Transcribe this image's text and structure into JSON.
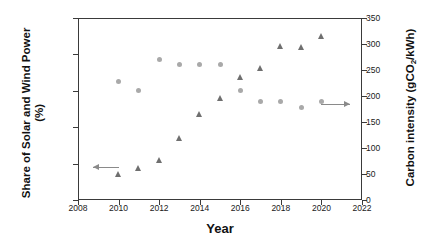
{
  "chart_data": {
    "type": "scatter",
    "title": "",
    "xlabel": "Year",
    "ylabel": "Share of Solar and Wind Power (%)",
    "ylabel_line1": "Share of Solar and Wind Power",
    "ylabel_line2": "(%)",
    "y2label": "Carbon intensity (gCO2/kWh)",
    "y2label_pre": "Carbon intensity (gCO",
    "y2label_sub": "2",
    "y2label_post": "/kWh)",
    "xlim": [
      2008,
      2022
    ],
    "ylim": [
      0,
      25
    ],
    "y2lim": [
      0,
      350
    ],
    "xticks": [
      2008,
      2010,
      2012,
      2014,
      2016,
      2018,
      2020,
      2022
    ],
    "yticks": [
      0,
      5,
      10,
      15,
      20,
      25
    ],
    "y2ticks": [
      0,
      50,
      100,
      150,
      200,
      250,
      300,
      350
    ],
    "grid": false,
    "legend": "none",
    "x": [
      2010,
      2011,
      2012,
      2013,
      2014,
      2015,
      2016,
      2017,
      2018,
      2019,
      2020
    ],
    "series": [
      {
        "name": "Share of Solar and Wind Power",
        "axis": "left",
        "marker": "triangle",
        "color": "#6f6f6f",
        "unit": "%",
        "values": [
          3.5,
          4.3,
          5.4,
          8.5,
          11.8,
          13.9,
          16.8,
          18.1,
          21.1,
          21.0,
          22.5
        ]
      },
      {
        "name": "Carbon intensity",
        "axis": "right",
        "marker": "circle",
        "color": "#a9a9a9",
        "unit": "gCO2/kWh",
        "values": [
          228,
          210,
          270,
          260,
          260,
          260,
          210,
          190,
          189,
          178,
          189
        ]
      }
    ],
    "annotations": [
      {
        "name": "left-axis-pointer",
        "direction": "left",
        "axis": "left",
        "x_start": 2010.0,
        "x_end": 2008.75,
        "y": 4.5
      },
      {
        "name": "right-axis-pointer",
        "direction": "right",
        "axis": "right",
        "x_start": 2020.0,
        "x_end": 2021.4,
        "y": 185
      }
    ]
  }
}
